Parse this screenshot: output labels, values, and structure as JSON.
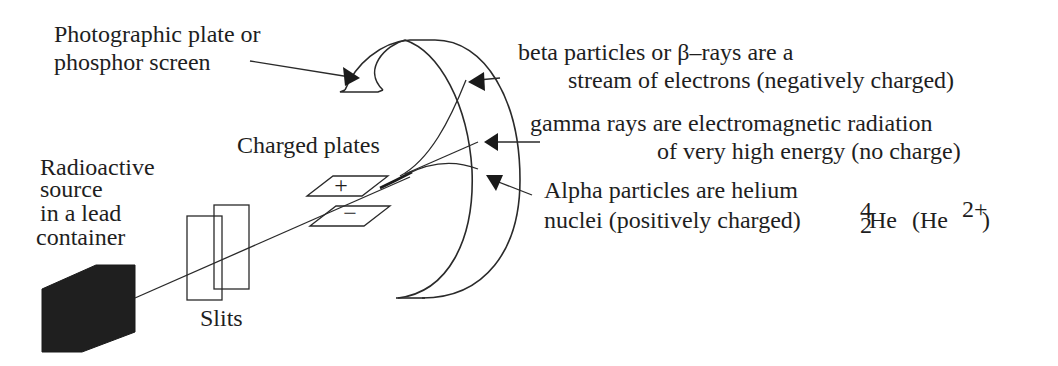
{
  "diagram": {
    "type": "apparatus-schematic",
    "labels": {
      "screen": [
        "Photographic plate or",
        "phosphor screen"
      ],
      "beta": [
        "beta particles or β–rays are a",
        "stream of electrons (negatively charged)"
      ],
      "gamma": [
        "gamma rays are electromagnetic radiation",
        "of very high energy (no charge)"
      ],
      "alpha": [
        "Alpha particles are helium",
        "nuclei (positively charged)"
      ],
      "alpha_formula": {
        "mass_number": "4",
        "atomic_number": "2",
        "symbol": "He",
        "ion_open": "(He",
        "ion_charge": "2+",
        "ion_close": ")"
      },
      "plates": "Charged plates",
      "plate_positive": "+",
      "plate_negative": "−",
      "source": [
        "Radioactive",
        "source",
        "in a lead",
        "container"
      ],
      "slits": "Slits"
    },
    "components": [
      {
        "id": "lead-container",
        "fill": "#1f1f1f"
      },
      {
        "id": "slits",
        "count": 2
      },
      {
        "id": "charged-plates",
        "count": 2,
        "polarity": [
          "+",
          "-"
        ]
      },
      {
        "id": "phosphor-screen",
        "shape": "curved band"
      }
    ],
    "beams": [
      {
        "name": "beta",
        "deflection": "strong upward (toward + plate)"
      },
      {
        "name": "gamma",
        "deflection": "none"
      },
      {
        "name": "alpha",
        "deflection": "slight downward (toward - plate)"
      }
    ],
    "colors": {
      "ink": "#1e1e1e",
      "source_fill": "#1f1f1f",
      "background": "#ffffff"
    }
  }
}
